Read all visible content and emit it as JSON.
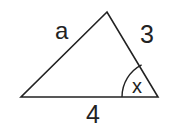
{
  "diagram": {
    "type": "triangle",
    "vertices": {
      "apex": [
        107,
        12
      ],
      "bottom_left": [
        21,
        97
      ],
      "bottom_right": [
        158,
        97
      ]
    },
    "labels": {
      "left_side": "a",
      "right_side": "3",
      "base": "4",
      "angle": "x"
    },
    "angle_marker": {
      "vertex": "bottom_right",
      "radius": 36
    },
    "colors": {
      "stroke": "#222222",
      "background": "#ffffff"
    }
  }
}
